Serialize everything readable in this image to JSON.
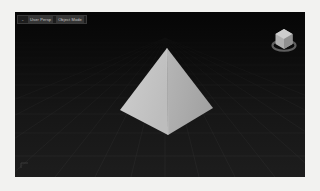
{
  "app": {
    "background_color": "#f2f2f0"
  },
  "viewport": {
    "name": "3d-viewport",
    "background_color": "#111111",
    "grid_color": "#4a4a4a",
    "horizon_color": "#0a0a0a",
    "header": {
      "icon_glyph": "⌄",
      "segments": [
        {
          "label": "User Persp"
        },
        {
          "label": "Object Mode"
        }
      ]
    }
  },
  "gizmo": {
    "name": "view-cube-gizmo",
    "cube_color": "#b4b4b4",
    "cube_top_color": "#cccccc",
    "cube_side_color": "#8e8e8e",
    "ring_color": "#6f6f6f"
  },
  "object": {
    "name": "pyramid",
    "type": "square-pyramid",
    "apex": {
      "x": 152,
      "y": 36
    },
    "base_left": {
      "x": 105,
      "y": 98
    },
    "base_right": {
      "x": 198,
      "y": 96
    },
    "base_front": {
      "x": 153,
      "y": 123
    },
    "face_left_color": "#c6c6c6",
    "face_right_color": "#aeaeae",
    "edge_color": "#d8d8d8"
  }
}
